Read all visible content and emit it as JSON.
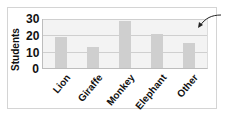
{
  "chart_data": {
    "type": "bar",
    "title": "",
    "xlabel": "",
    "ylabel": "Students",
    "categories": [
      "Lion",
      "Giraffe",
      "Monkey",
      "Elephant",
      "Other"
    ],
    "values": [
      19,
      13,
      29,
      21,
      15
    ],
    "ylim": [
      0,
      30
    ],
    "yticks": [
      "0",
      "10",
      "20",
      "30"
    ],
    "grid": true,
    "legend": null,
    "annotations": [
      "arrow pointing to plot area (upper right)"
    ]
  },
  "colors": {
    "bar": "#cfcfcf",
    "plot_bg": "#f3f3f3",
    "grid": "#cfcfcf"
  }
}
